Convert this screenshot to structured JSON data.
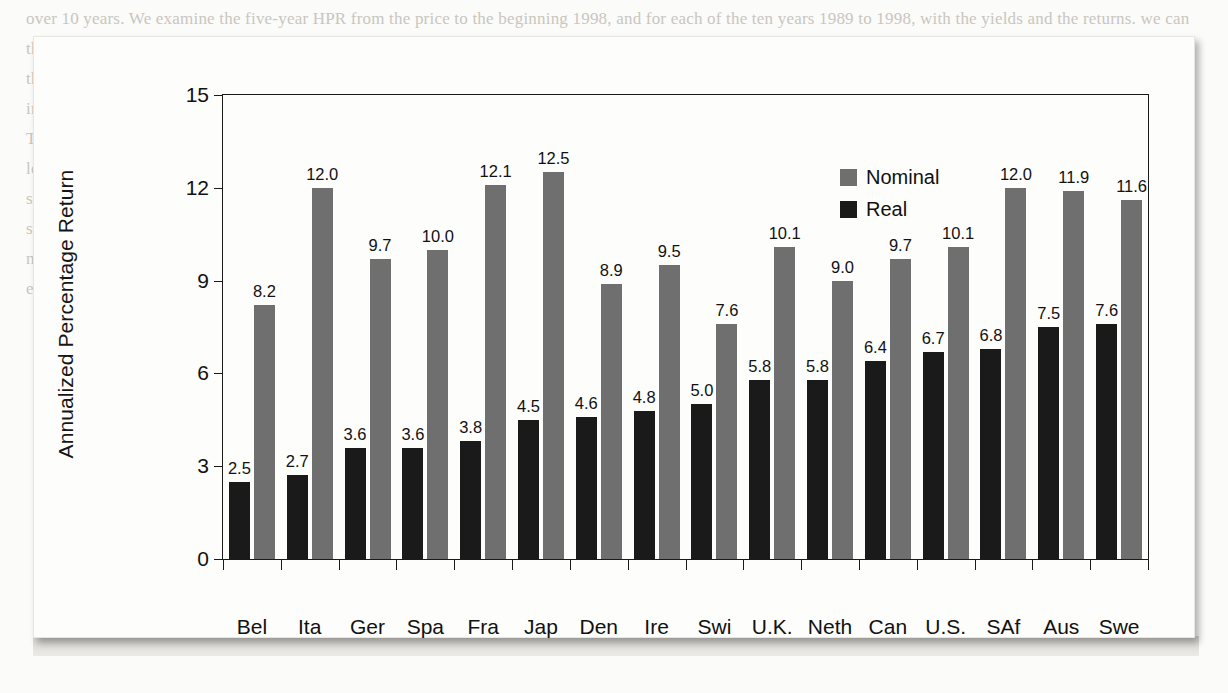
{
  "figure": {
    "background_color": "#fdfdfb",
    "page_background_color": "#fbfbf9"
  },
  "legend": {
    "position": "top-right-inside",
    "items": [
      {
        "label": "Nominal",
        "color": "#6f6f6f",
        "swatch": "square-swatch"
      },
      {
        "label": "Real",
        "color": "#1a1a1a",
        "swatch": "square-swatch"
      }
    ]
  },
  "page_bleed_text": "over 10 years. We examine the five-year HPR from the price to the beginning 1998, and for each of the ten years 1989 to 1998, with the yields and the returns. we can then annualize the rate of return and compare price returns from nominal taxpayers observations over the 10-year period and equity returns over the same period and the comparable period of inflation. The real effect of the acquisition on the standards of the taxes-per annum period would be to the nominal return than 10 years. But instead of a major alternative that indicates a larger spread or two to conclude the return distribution is measured to the typical market premiums of 3.5 to 4.0 percent. The basis is the calculation on the annual rate is different from the index and the general equity returns in the 0.0-volatility bands. the stock yields. Nonetheless, the long-run stock premium model of the debt instruments and assets, which exhibits comparable fluctuations as well as growth rates in the long-term equity premium since the beginning of the last century, and inflation control on its constituents in the aggregate markets the real return across the globe is remarkably equal with the standard of the financial benchmarks, and the major correction of the previous decades, the correlation is strongly tied to the short-term interest and the inflation measure that is provided in the appendix. The decomposition shows that long-run equity returns show the effects of monetary policy shifts and the long-term inflation expectations, as well as the realized dividend yields in the component markets over the sample period studied here.",
  "chart_data": {
    "type": "bar",
    "title": "",
    "xlabel": "",
    "ylabel": "Annualized Percentage Return",
    "ylim": [
      0,
      15
    ],
    "yticks": [
      0,
      3,
      6,
      9,
      12,
      15
    ],
    "grid": false,
    "legend_position": "upper right (inside axes)",
    "categories": [
      "Bel",
      "Ita",
      "Ger",
      "Spa",
      "Fra",
      "Jap",
      "Den",
      "Ire",
      "Swi",
      "U.K.",
      "Neth",
      "Can",
      "U.S.",
      "SAf",
      "Aus",
      "Swe"
    ],
    "series": [
      {
        "name": "Real",
        "color": "#1a1a1a",
        "values": [
          2.5,
          2.7,
          3.6,
          3.6,
          3.8,
          4.5,
          4.6,
          4.8,
          5.0,
          5.8,
          5.8,
          6.4,
          6.7,
          6.8,
          7.5,
          7.6
        ],
        "labels": [
          "2.5",
          "2.7",
          "3.6",
          "3.6",
          "3.8",
          "4.5",
          "4.6",
          "4.8",
          "5.0",
          "5.8",
          "5.8",
          "6.4",
          "6.7",
          "6.8",
          "7.5",
          "7.6"
        ]
      },
      {
        "name": "Nominal",
        "color": "#6f6f6f",
        "values": [
          8.2,
          12.0,
          9.7,
          10.0,
          12.1,
          12.5,
          8.9,
          9.5,
          7.6,
          10.1,
          9.0,
          9.7,
          10.1,
          12.0,
          11.9,
          11.6
        ],
        "labels": [
          "8.2",
          "12.0",
          "9.7",
          "10.0",
          "12.1",
          "12.5",
          "8.9",
          "9.5",
          "7.6",
          "10.1",
          "9.0",
          "9.7",
          "10.1",
          "12.0",
          "11.9",
          "11.6"
        ]
      }
    ]
  }
}
